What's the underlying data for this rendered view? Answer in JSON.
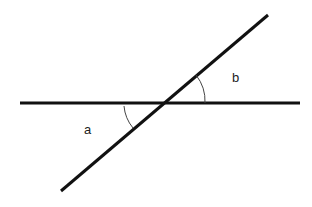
{
  "diagram": {
    "type": "intersecting-lines-angles",
    "labels": {
      "a": "a",
      "b": "b"
    },
    "colors": {
      "line": "#111111",
      "arc": "#444444",
      "background": "#ffffff"
    }
  }
}
